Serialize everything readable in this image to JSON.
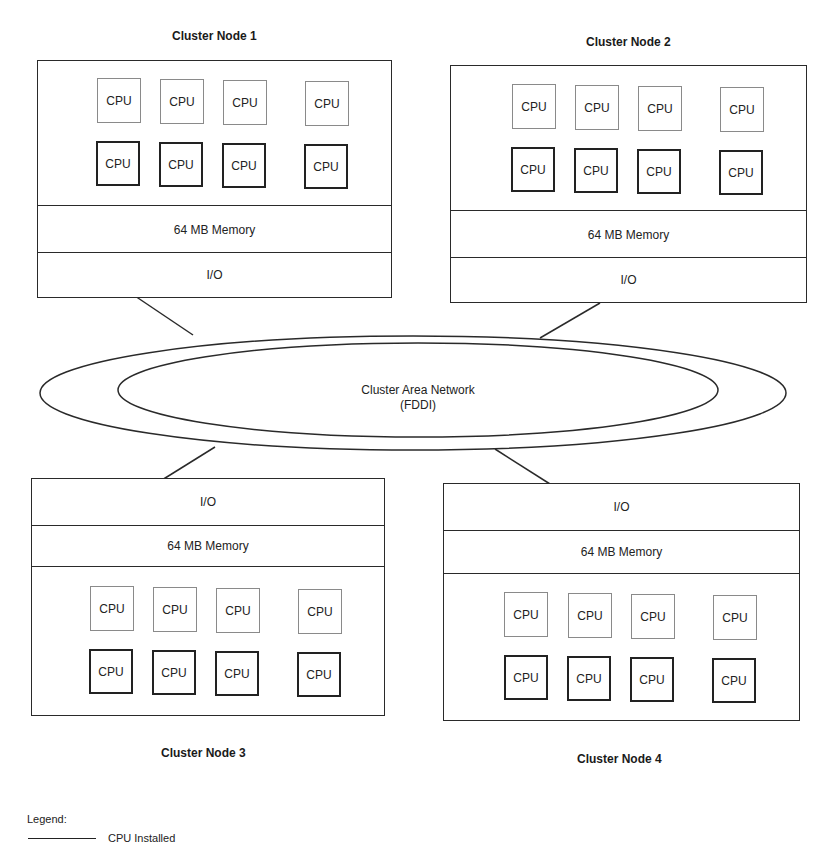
{
  "nodes": [
    {
      "title": "Cluster Node 1",
      "memory": "64 MB Memory",
      "io": "I/O",
      "cpu_label": "CPU"
    },
    {
      "title": "Cluster Node 2",
      "memory": "64 MB Memory",
      "io": "I/O",
      "cpu_label": "CPU"
    },
    {
      "title": "Cluster Node 3",
      "memory": "64 MB Memory",
      "io": "I/O",
      "cpu_label": "CPU"
    },
    {
      "title": "Cluster Node 4",
      "memory": "64 MB Memory",
      "io": "I/O",
      "cpu_label": "CPU"
    }
  ],
  "network": {
    "line1": "Cluster Area Network",
    "line2": "(FDDI)"
  },
  "legend": {
    "title": "Legend:",
    "items": [
      {
        "label": "CPU Installed"
      }
    ]
  },
  "colors": {
    "line": "#2a2a2a",
    "cpu_empty_border": "#8a8a8a",
    "cpu_installed_border": "#222222"
  }
}
